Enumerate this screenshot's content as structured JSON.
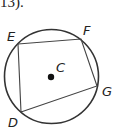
{
  "problem": {
    "number_label": "13)."
  },
  "diagram": {
    "circle": {
      "center_label": "C",
      "cx": 51.5,
      "cy": 76.5,
      "r": 47
    },
    "vertices": [
      {
        "label": "E",
        "x": 18,
        "y": 44,
        "lx": 7,
        "ly": 41
      },
      {
        "label": "F",
        "x": 81,
        "y": 39,
        "lx": 82,
        "ly": 35
      },
      {
        "label": "G",
        "x": 97,
        "y": 86,
        "lx": 102,
        "ly": 96
      },
      {
        "label": "D",
        "x": 21,
        "y": 112,
        "lx": 8,
        "ly": 127
      }
    ],
    "polygon_name": "DEFG",
    "colors": {
      "stroke": "#333333",
      "center_dot": "#111111",
      "text": "#222222"
    }
  }
}
